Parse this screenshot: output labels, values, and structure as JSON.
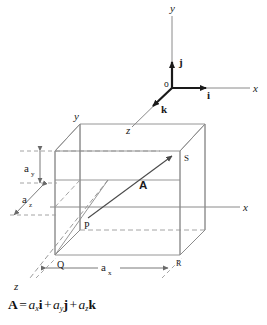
{
  "figure": {
    "title_caption": "",
    "upper_axes": {
      "name": "unit-vector-triad",
      "origin_label": "o",
      "axis_labels": {
        "x": "x",
        "y": "y",
        "z": "z"
      },
      "unit_vector_labels": {
        "i": "i",
        "j": "j",
        "k": "k"
      }
    },
    "lower_box": {
      "name": "rectangular-parallelepiped",
      "axis_labels": {
        "x": "x",
        "y": "y",
        "z": "z"
      },
      "vertex_labels": {
        "P": "P",
        "Q": "Q",
        "R": "R",
        "S": "S"
      },
      "vector_label": "A",
      "dimension_labels": {
        "ax": {
          "base": "a",
          "sub": "x"
        },
        "ay": {
          "base": "a",
          "sub": "y"
        },
        "az": {
          "base": "a",
          "sub": "z"
        }
      }
    },
    "equation": {
      "lhs": "A",
      "equals": "=",
      "terms": [
        {
          "coef": "a",
          "sub": "x",
          "unit": "i"
        },
        {
          "coef": "a",
          "sub": "y",
          "unit": "j"
        },
        {
          "coef": "a",
          "sub": "z",
          "unit": "k"
        }
      ],
      "plus": "+",
      "plain_text": "A = a_x i + a_y j + a_z k"
    },
    "colors": {
      "background": "#ffffff",
      "axis_gray": "#8a8a8a",
      "unit_vector_dark": "#1a1a1a",
      "box_edge": "#8a8a8a",
      "text": "#1a1a1a"
    }
  }
}
